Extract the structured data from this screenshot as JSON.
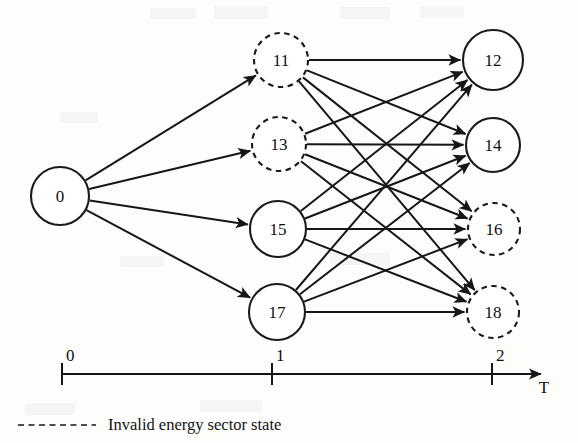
{
  "figure": {
    "type": "state-transition-trellis-diagram",
    "background_color": "#fdfdfc",
    "stroke_color": "#161616"
  },
  "nodes": [
    {
      "id": "n0",
      "label": "0",
      "column": 0,
      "cx": 60,
      "cy": 196,
      "r": 29,
      "style": "solid",
      "valid": true
    },
    {
      "id": "n11",
      "label": "11",
      "column": 1,
      "cx": 281,
      "cy": 60,
      "r": 27,
      "style": "dashed",
      "valid": false
    },
    {
      "id": "n13",
      "label": "13",
      "column": 1,
      "cx": 279,
      "cy": 144,
      "r": 27,
      "style": "dashed",
      "valid": false
    },
    {
      "id": "n15",
      "label": "15",
      "column": 1,
      "cx": 278,
      "cy": 229,
      "r": 28,
      "style": "solid",
      "valid": true
    },
    {
      "id": "n17",
      "label": "17",
      "column": 1,
      "cx": 277,
      "cy": 312,
      "r": 28,
      "style": "solid",
      "valid": true
    },
    {
      "id": "n12",
      "label": "12",
      "column": 2,
      "cx": 493,
      "cy": 60,
      "r": 30,
      "style": "solid",
      "valid": true
    },
    {
      "id": "n14",
      "label": "14",
      "column": 2,
      "cx": 493,
      "cy": 145,
      "r": 27,
      "style": "solid",
      "valid": true
    },
    {
      "id": "n16",
      "label": "16",
      "column": 2,
      "cx": 494,
      "cy": 229,
      "r": 26,
      "style": "dashed",
      "valid": false
    },
    {
      "id": "n18",
      "label": "18",
      "column": 2,
      "cx": 493,
      "cy": 312,
      "r": 26,
      "style": "dashed",
      "valid": false
    }
  ],
  "edges": [
    {
      "from": "n0",
      "to": "n11"
    },
    {
      "from": "n0",
      "to": "n13"
    },
    {
      "from": "n0",
      "to": "n15"
    },
    {
      "from": "n0",
      "to": "n17"
    },
    {
      "from": "n11",
      "to": "n12"
    },
    {
      "from": "n11",
      "to": "n14"
    },
    {
      "from": "n11",
      "to": "n16"
    },
    {
      "from": "n11",
      "to": "n18"
    },
    {
      "from": "n13",
      "to": "n12"
    },
    {
      "from": "n13",
      "to": "n14"
    },
    {
      "from": "n13",
      "to": "n16"
    },
    {
      "from": "n13",
      "to": "n18"
    },
    {
      "from": "n15",
      "to": "n12"
    },
    {
      "from": "n15",
      "to": "n14"
    },
    {
      "from": "n15",
      "to": "n16"
    },
    {
      "from": "n15",
      "to": "n18"
    },
    {
      "from": "n17",
      "to": "n12"
    },
    {
      "from": "n17",
      "to": "n14"
    },
    {
      "from": "n17",
      "to": "n16"
    },
    {
      "from": "n17",
      "to": "n18"
    }
  ],
  "axis": {
    "name": "T",
    "name_x": 544,
    "name_y": 393,
    "y": 374,
    "x_start": 62,
    "x_end": 541,
    "ticks": [
      {
        "label": "0",
        "x": 62
      },
      {
        "label": "1",
        "x": 272
      },
      {
        "label": "2",
        "x": 492
      }
    ]
  },
  "legend": {
    "dash_x1": 18,
    "dash_x2": 96,
    "dash_y": 425,
    "text": "Invalid energy sector state",
    "text_x": 108,
    "text_y": 415
  }
}
